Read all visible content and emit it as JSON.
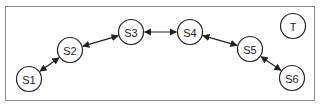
{
  "diagram": {
    "nodes": [
      {
        "id": "S1",
        "label": "S1",
        "x": 29,
        "y": 79
      },
      {
        "id": "S2",
        "label": "S2",
        "x": 70,
        "y": 50
      },
      {
        "id": "S3",
        "label": "S3",
        "x": 131,
        "y": 32
      },
      {
        "id": "S4",
        "label": "S4",
        "x": 190,
        "y": 32
      },
      {
        "id": "S5",
        "label": "S5",
        "x": 250,
        "y": 49
      },
      {
        "id": "S6",
        "label": "S6",
        "x": 292,
        "y": 78
      },
      {
        "id": "T",
        "label": "T",
        "x": 293,
        "y": 26
      }
    ],
    "edges": [
      {
        "from": "S1",
        "to": "S2",
        "bidirectional": true
      },
      {
        "from": "S2",
        "to": "S3",
        "bidirectional": true
      },
      {
        "from": "S3",
        "to": "S4",
        "bidirectional": true
      },
      {
        "from": "S4",
        "to": "S5",
        "bidirectional": true
      },
      {
        "from": "S5",
        "to": "S6",
        "bidirectional": true
      }
    ],
    "node_radius": 12.5,
    "colors": {
      "stroke": "#222222",
      "border": "#8a8a8a",
      "background": "#ffffff"
    }
  }
}
